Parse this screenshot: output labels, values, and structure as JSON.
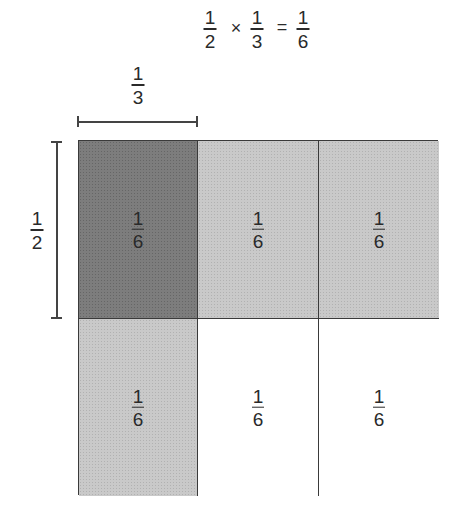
{
  "equation": {
    "term1": {
      "num": "1",
      "den": "2"
    },
    "operator": "×",
    "term2": {
      "num": "1",
      "den": "3"
    },
    "equals": "=",
    "result": {
      "num": "1",
      "den": "6"
    }
  },
  "dimension_labels": {
    "width": {
      "num": "1",
      "den": "3"
    },
    "height": {
      "num": "1",
      "den": "2"
    }
  },
  "grid": {
    "rows": 2,
    "columns": 3,
    "cells": [
      {
        "row": 0,
        "col": 0,
        "num": "1",
        "den": "6",
        "shade": "dark"
      },
      {
        "row": 0,
        "col": 1,
        "num": "1",
        "den": "6",
        "shade": "light"
      },
      {
        "row": 0,
        "col": 2,
        "num": "1",
        "den": "6",
        "shade": "light"
      },
      {
        "row": 1,
        "col": 0,
        "num": "1",
        "den": "6",
        "shade": "light"
      },
      {
        "row": 1,
        "col": 1,
        "num": "1",
        "den": "6",
        "shade": "white"
      },
      {
        "row": 1,
        "col": 2,
        "num": "1",
        "den": "6",
        "shade": "white"
      }
    ]
  },
  "colors": {
    "dark_cell": "#7d7d7d",
    "light_cell": "#c9c9c9",
    "white_cell": "#ffffff",
    "border": "#3a3a3a",
    "text": "#2a2a2a"
  }
}
